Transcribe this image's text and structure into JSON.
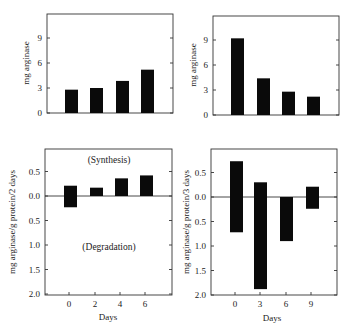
{
  "chart_data": [
    {
      "id": "top_left",
      "type": "bar",
      "title": "",
      "xlabel": "",
      "ylabel": "mg arginase",
      "categories": [
        "0",
        "2",
        "4",
        "6"
      ],
      "values": [
        2.8,
        3.0,
        3.85,
        5.2
      ],
      "yticks": [
        "0",
        "3",
        "6",
        "9"
      ],
      "ylim": [
        0,
        12
      ],
      "grid": false,
      "legend": null
    },
    {
      "id": "top_right",
      "type": "bar",
      "title": "",
      "xlabel": "",
      "ylabel": "mg arginase",
      "categories": [
        "0",
        "3",
        "6",
        "9"
      ],
      "values": [
        9.2,
        4.4,
        2.8,
        2.2
      ],
      "yticks": [
        "0",
        "3",
        "6",
        "9"
      ],
      "ylim": [
        0,
        12
      ],
      "grid": false,
      "legend": null
    },
    {
      "id": "bottom_left",
      "type": "bar",
      "title": "",
      "xlabel": "Days",
      "ylabel": "mg arginase/g protein/2 days",
      "categories": [
        "0",
        "2",
        "4",
        "6"
      ],
      "series": [
        {
          "name": "Synthesis",
          "values": [
            0.21,
            0.17,
            0.36,
            0.42
          ]
        },
        {
          "name": "Degradation",
          "values": [
            0.23,
            0.0,
            0.0,
            0.0
          ]
        }
      ],
      "annotations": [
        "(Synthesis)",
        "(Degradation)"
      ],
      "yticks": [
        "0.5",
        "0.0",
        "0.5",
        "1.0",
        "1.5",
        "2.0"
      ],
      "ylim": [
        -2.0,
        1.0
      ],
      "grid": false,
      "legend": null
    },
    {
      "id": "bottom_right",
      "type": "bar",
      "title": "",
      "xlabel": "Days",
      "ylabel": "mg arginase/g protein/3 days",
      "categories": [
        "0",
        "3",
        "6",
        "9"
      ],
      "series": [
        {
          "name": "Synthesis",
          "values": [
            0.73,
            0.3,
            0.0,
            0.21
          ]
        },
        {
          "name": "Degradation",
          "values": [
            0.72,
            1.88,
            0.9,
            0.24
          ]
        }
      ],
      "yticks": [
        "0.5",
        "0.0",
        "0.5",
        "1.0",
        "1.5",
        "2.0"
      ],
      "ylim": [
        -2.0,
        1.0
      ],
      "grid": false,
      "legend": null
    }
  ],
  "labels": {
    "tl_ylabel": "mg arginase",
    "tr_ylabel": "mg arginase",
    "bl_ylabel": "mg arginase/g protein/2 days",
    "br_ylabel": "mg arginase/g protein/3 days",
    "bl_xlabel": "Days",
    "br_xlabel": "Days",
    "synthesis": "(Synthesis)",
    "degradation": "(Degradation)"
  },
  "colors": {
    "bar": "#0a0a0a",
    "axis": "#333333",
    "background": "#ffffff"
  }
}
